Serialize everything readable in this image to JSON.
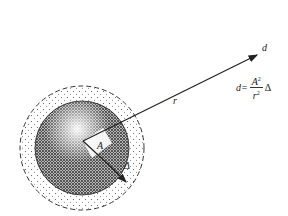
{
  "diagram": {
    "labels": {
      "d_top": "d",
      "r": "r",
      "A": "A",
      "delta": "Δ"
    },
    "formula": {
      "lhs": "d=",
      "numerator": "A",
      "numerator_exp": "2",
      "denominator": "r",
      "denominator_exp": "2",
      "trailing": "Δ"
    },
    "colors": {
      "stroke": "#222222",
      "background": "#ffffff"
    }
  }
}
